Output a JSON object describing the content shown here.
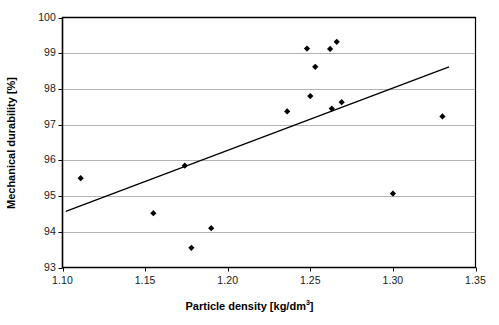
{
  "chart_data": {
    "type": "scatter",
    "title": "",
    "xlabel": "Particle density [kg/dm",
    "xlabel_sup": "3",
    "xlabel_tail": "]",
    "ylabel": "Mechanical durability [%]",
    "xlim": [
      1.1,
      1.35
    ],
    "ylim": [
      93,
      100
    ],
    "xticks": [
      "1.10",
      "1.15",
      "1.20",
      "1.25",
      "1.30",
      "1.35"
    ],
    "xtick_values": [
      1.1,
      1.15,
      1.2,
      1.25,
      1.3,
      1.35
    ],
    "yticks": [
      "93",
      "94",
      "95",
      "96",
      "97",
      "98",
      "99",
      "100"
    ],
    "ytick_values": [
      93,
      94,
      95,
      96,
      97,
      98,
      99,
      100
    ],
    "grid": "horizontal",
    "legend": "none",
    "marker": "diamond",
    "marker_color": "#000000",
    "points": [
      {
        "x": 1.111,
        "y": 95.5
      },
      {
        "x": 1.155,
        "y": 94.52
      },
      {
        "x": 1.174,
        "y": 95.85
      },
      {
        "x": 1.178,
        "y": 93.55
      },
      {
        "x": 1.19,
        "y": 94.1
      },
      {
        "x": 1.236,
        "y": 97.37
      },
      {
        "x": 1.248,
        "y": 99.13
      },
      {
        "x": 1.25,
        "y": 97.8
      },
      {
        "x": 1.253,
        "y": 98.62
      },
      {
        "x": 1.262,
        "y": 99.12
      },
      {
        "x": 1.263,
        "y": 97.45
      },
      {
        "x": 1.266,
        "y": 99.32
      },
      {
        "x": 1.269,
        "y": 97.63
      },
      {
        "x": 1.3,
        "y": 95.07
      },
      {
        "x": 1.33,
        "y": 97.23
      }
    ],
    "trendline": {
      "type": "linear",
      "x_start": 1.102,
      "y_start": 94.57,
      "x_end": 1.334,
      "y_end": 98.62,
      "color": "#000000"
    },
    "axis_color": "#000000",
    "grid_color": "#b3b3b3",
    "background": "#ffffff"
  }
}
